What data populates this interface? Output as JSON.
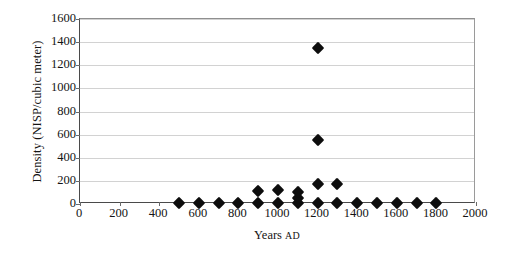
{
  "chart_data": {
    "type": "scatter",
    "title": "",
    "xlabel": "Years AD",
    "ylabel": "Density (NISP/cubic meter)",
    "xlabel_main": "Years ",
    "xlabel_smallcaps": "AD",
    "xlim": [
      0,
      2000
    ],
    "ylim": [
      0,
      1600
    ],
    "xticks": [
      0,
      200,
      400,
      600,
      800,
      1000,
      1200,
      1400,
      1600,
      1800,
      2000
    ],
    "yticks": [
      0,
      200,
      400,
      600,
      800,
      1000,
      1200,
      1400,
      1600
    ],
    "xtick_labels": [
      "0",
      "200",
      "400",
      "600",
      "800",
      "1000",
      "1200",
      "1400",
      "1600",
      "1800",
      "2000"
    ],
    "ytick_labels": [
      "0",
      "200",
      "400",
      "600",
      "800",
      "1000",
      "1200",
      "1400",
      "1600"
    ],
    "grid": true,
    "grid_axis": "y",
    "legend": false,
    "marker": "diamond",
    "marker_color": "#0d0d0d",
    "series": [
      {
        "name": "Bone density",
        "x": [
          500,
          600,
          700,
          800,
          900,
          900,
          1000,
          1000,
          1100,
          1100,
          1100,
          1200,
          1200,
          1200,
          1200,
          1300,
          1300,
          1400,
          1500,
          1600,
          1700,
          1800
        ],
        "y": [
          5,
          5,
          5,
          12,
          5,
          110,
          5,
          120,
          5,
          55,
          105,
          5,
          175,
          555,
          1350,
          5,
          175,
          8,
          8,
          8,
          12,
          8
        ]
      }
    ]
  }
}
